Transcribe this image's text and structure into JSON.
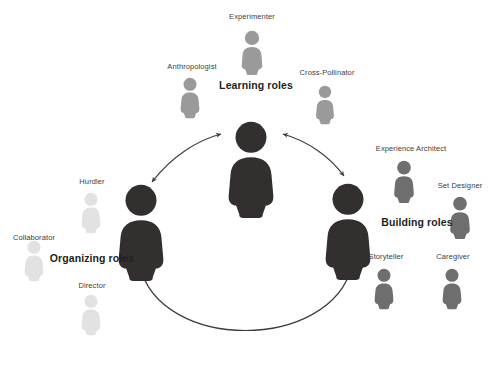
{
  "diagram": {
    "background": "#ffffff",
    "hub_color": "#332f2f",
    "satellite_colors": {
      "learning": "#9a9a9a",
      "building": "#6e6e6e",
      "organizing": "#e2e2e2"
    },
    "arrow_color": "#3f3b3b"
  },
  "groups": [
    {
      "key": "learning",
      "label": "Learning roles",
      "label_x": 256,
      "label_y": 85,
      "hub": {
        "x": 251,
        "y": 120,
        "scale": 1.0
      },
      "satellites": [
        {
          "name": "Experimenter",
          "x": 252,
          "y": 30,
          "label_x": 252,
          "label_y": 12,
          "scale": 0.46
        },
        {
          "name": "Anthropologist",
          "x": 190,
          "y": 77,
          "label_x": 192,
          "label_y": 62,
          "scale": 0.42
        },
        {
          "name": "Cross-Pollinator",
          "x": 325,
          "y": 85,
          "label_x": 327,
          "label_y": 68,
          "scale": 0.4
        }
      ]
    },
    {
      "key": "building",
      "label": "Building roles",
      "label_x": 417,
      "label_y": 222,
      "hub": {
        "x": 348,
        "y": 182,
        "scale": 1.0
      },
      "satellites": [
        {
          "name": "Experience Architect",
          "x": 404,
          "y": 160,
          "label_x": 411,
          "label_y": 144,
          "scale": 0.44
        },
        {
          "name": "Set Designer",
          "x": 460,
          "y": 196,
          "label_x": 460,
          "label_y": 181,
          "scale": 0.44
        },
        {
          "name": "Storyteller",
          "x": 384,
          "y": 268,
          "label_x": 386,
          "label_y": 252,
          "scale": 0.42
        },
        {
          "name": "Caregiver",
          "x": 452,
          "y": 268,
          "label_x": 453,
          "label_y": 252,
          "scale": 0.42
        }
      ]
    },
    {
      "key": "organizing",
      "label": "Organizing roles",
      "label_x": 92,
      "label_y": 258,
      "hub": {
        "x": 141,
        "y": 183,
        "scale": 1.0
      },
      "satellites": [
        {
          "name": "Hurdler",
          "x": 91,
          "y": 192,
          "label_x": 92,
          "label_y": 177,
          "scale": 0.42
        },
        {
          "name": "Collaborator",
          "x": 34,
          "y": 240,
          "label_x": 34,
          "label_y": 233,
          "scale": 0.42
        },
        {
          "name": "Director",
          "x": 91,
          "y": 294,
          "label_x": 92,
          "label_y": 281,
          "scale": 0.42
        }
      ]
    }
  ],
  "connectors": [
    {
      "name": "learning-organizing-arrow",
      "path": "M 152 182 C 172 156 198 140 221 134",
      "double": true
    },
    {
      "name": "learning-building-arrow",
      "path": "M 283 134 C 308 141 330 157 344 176",
      "double": true
    },
    {
      "name": "organizing-building-arrow",
      "path": "M 140 266 C 160 352 330 352 352 266",
      "double": true
    }
  ]
}
